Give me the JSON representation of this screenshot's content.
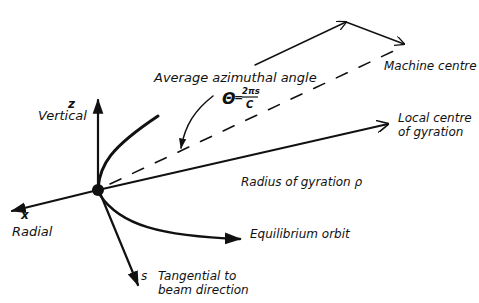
{
  "diagram": {
    "type": "coordinate-system",
    "labels": {
      "average_azimuthal_angle": "Average azimuthal angle",
      "theta_symbol": "Θ",
      "equals": "=",
      "formula_numerator": "2πs",
      "formula_denominator": "C",
      "machine_centre": "Machine centre",
      "local_centre_line1": "Local centre",
      "local_centre_line2": "of gyration",
      "z_axis": "z",
      "vertical": "Vertical",
      "radius_of_gyration": "Radius of gyration ρ",
      "x_axis": "x",
      "radial": "Radial",
      "equilibrium_orbit": "Equilibrium orbit",
      "s_axis": "s",
      "tangential_line1": "Tangential to",
      "tangential_line2": "beam direction"
    },
    "colors": {
      "ink": "#111111",
      "background": "#ffffff"
    }
  }
}
